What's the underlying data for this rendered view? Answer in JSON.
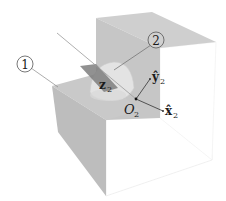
{
  "diagram": {
    "type": "3d-block-with-hemispherical-joint",
    "colors": {
      "gray_face": "#c4c4c4",
      "gray_face_dark": "#b6b6b6",
      "top_face": "#d2d2d2",
      "white_face": "#ffffff",
      "edge": "#e9e9e9",
      "hemisphere": "#e4e4e4",
      "groove": "#7e7e7e",
      "ink": "#1a1a1a"
    },
    "labels": {
      "body1": "1",
      "body2": "2",
      "origin": "O",
      "origin_sub": "2",
      "x_axis": "x̂",
      "x_axis_sub": "2",
      "y_axis": "ŷ",
      "y_axis_sub": "2",
      "z_axis": "z",
      "z_axis_sub": "2"
    }
  }
}
